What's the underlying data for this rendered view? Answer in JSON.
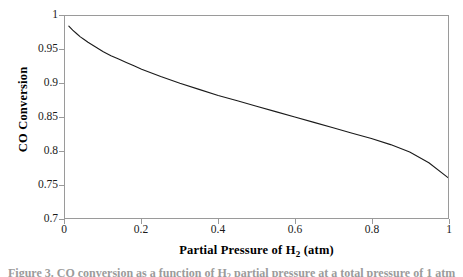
{
  "chart_data": {
    "type": "line",
    "title": "",
    "xlabel": "Partial Pressure of H2 (atm)",
    "xlabel_parts": {
      "pre": "Partial Pressure of H",
      "sub": "2",
      "post": " (atm)"
    },
    "ylabel": "CO Conversion",
    "xlim": [
      0,
      1
    ],
    "ylim": [
      0.7,
      1
    ],
    "xticks": [
      "0",
      "0.2",
      "0.4",
      "0.6",
      "0.8",
      "1"
    ],
    "xtick_values": [
      0,
      0.2,
      0.4,
      0.6,
      0.8,
      1
    ],
    "ytick_values": [
      0.7,
      0.75,
      0.8,
      0.85,
      0.9,
      0.95,
      1
    ],
    "yticks": [
      "0.7",
      "0.75",
      "0.8",
      "0.85",
      "0.9",
      "0.95",
      "1"
    ],
    "grid": false,
    "legend": false,
    "series": [
      {
        "name": "CO Conversion",
        "color": "#1a1a1a",
        "line_width": 1,
        "x": [
          0.01,
          0.02,
          0.03,
          0.04,
          0.05,
          0.06,
          0.08,
          0.1,
          0.12,
          0.14,
          0.16,
          0.18,
          0.2,
          0.25,
          0.3,
          0.35,
          0.4,
          0.45,
          0.5,
          0.55,
          0.6,
          0.65,
          0.7,
          0.75,
          0.8,
          0.85,
          0.9,
          0.95,
          1.0
        ],
        "y": [
          0.985,
          0.979,
          0.974,
          0.969,
          0.965,
          0.961,
          0.954,
          0.947,
          0.941,
          0.936,
          0.931,
          0.926,
          0.921,
          0.91,
          0.9,
          0.891,
          0.882,
          0.874,
          0.866,
          0.858,
          0.85,
          0.842,
          0.834,
          0.826,
          0.818,
          0.809,
          0.798,
          0.782,
          0.76
        ]
      }
    ],
    "frame_color": "#9a9a9a",
    "background": "#ffffff"
  },
  "caption": {
    "text_pre": "Figure 3.  CO conversion as a function of H",
    "text_sub": "2",
    "text_post": " partial pressure at a total pressure of 1 atm"
  }
}
